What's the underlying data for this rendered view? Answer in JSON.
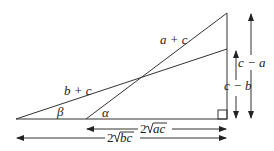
{
  "diagram": {
    "type": "geometry",
    "labels": {
      "hyp_a": "a + c",
      "hyp_b": "b + c",
      "angle_beta": "β",
      "angle_alpha": "α",
      "side_ca": "c − a",
      "side_cb": "c − b",
      "base_ac_coef": "2",
      "base_ac_rad": "ac",
      "base_bc_coef": "2",
      "base_bc_rad": "bc"
    },
    "colors": {
      "stroke": "#333333",
      "background": "#ffffff"
    }
  }
}
